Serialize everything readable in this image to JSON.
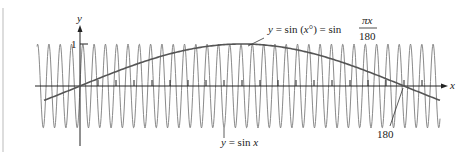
{
  "chart_data": {
    "type": "line",
    "title": "",
    "xlabel": "x",
    "ylabel": "y",
    "y_tick_labels": [
      "1"
    ],
    "x_tick_labels": [
      "180"
    ],
    "series": [
      {
        "name": "y = sin x",
        "description": "rapidly oscillating sine in radians, amplitude 1, ~36 periods over the shown range",
        "amplitude": 1,
        "color": "#8a8a8a"
      },
      {
        "name": "y = sin(x°) = sin πx/180",
        "description": "slow sine in degrees: 0 at x=0, peak 1 at x=90, 0 at x=180",
        "x": [
          -20,
          0,
          45,
          90,
          135,
          180,
          200
        ],
        "values": [
          -0.342,
          0,
          0.707,
          1,
          0.707,
          0,
          -0.342
        ],
        "color": "#555555"
      }
    ],
    "annotations": [
      {
        "text": "y = sin(x°) = sin πx/180",
        "points_to": "slow curve near peak"
      },
      {
        "text": "y = sin x",
        "points_to": "fast oscillating curve"
      },
      {
        "text": "180",
        "points_to": "x-intercept of slow curve"
      }
    ],
    "xlim": [
      -20,
      200
    ],
    "ylim": [
      -1.1,
      1.1
    ],
    "grid": false,
    "legend": "none"
  },
  "labels": {
    "y_axis": "y",
    "x_axis": "x",
    "one": "1",
    "slow_eq_left": "y = sin (x°) = sin",
    "slow_frac_num": "πx",
    "slow_frac_den": "180",
    "fast_eq": "y = sin x",
    "intercept": "180"
  }
}
